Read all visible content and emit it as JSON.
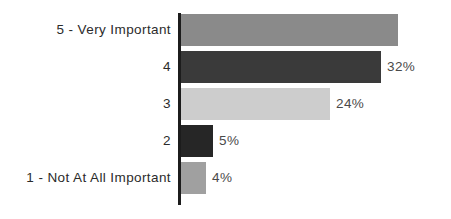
{
  "chart_data": {
    "type": "bar",
    "orientation": "horizontal",
    "title": "",
    "subtitle": "",
    "xlabel": "",
    "ylabel": "",
    "grid": false,
    "legend": null,
    "axis_line": true,
    "value_labels": true,
    "value_label_suffix": "%",
    "categories": [
      "5 - Very Important",
      "4",
      "3",
      "2",
      "1 - Not At All Important"
    ],
    "values": [
      35,
      32,
      24,
      5,
      4
    ],
    "value_labels_text": [
      "35%",
      "32%",
      "24%",
      "5%",
      "4%"
    ],
    "bar_colors": [
      "#8a8a8a",
      "#3a3a3a",
      "#cdcdcd",
      "#262626",
      "#a0a0a0"
    ],
    "bar_pixel_widths": [
      217,
      200,
      149,
      32,
      25
    ],
    "xlim": [
      0,
      40
    ]
  },
  "bars": [
    {
      "label": "5 - Very Important",
      "value": 35,
      "value_label": "35%",
      "color": "#8a8a8a",
      "width_px": "217px",
      "label_left_px": "403px"
    },
    {
      "label": "4",
      "value": 32,
      "value_label": "32%",
      "color": "#3a3a3a",
      "width_px": "200px",
      "label_left_px": "206px"
    },
    {
      "label": "3",
      "value": 24,
      "value_label": "24%",
      "color": "#cdcdcd",
      "width_px": "149px",
      "label_left_px": "155px"
    },
    {
      "label": "2",
      "value": 5,
      "value_label": "5%",
      "color": "#262626",
      "width_px": "32px",
      "label_left_px": "38px"
    },
    {
      "label": "1 - Not At All Important",
      "value": 4,
      "value_label": "4%",
      "color": "#a0a0a0",
      "width_px": "25px",
      "label_left_px": "31px"
    }
  ],
  "style": {
    "background": "#ffffff",
    "axis_color": "#1c1c1c",
    "category_label_color": "#2b2b2b",
    "value_label_color": "#4a4a4a"
  }
}
